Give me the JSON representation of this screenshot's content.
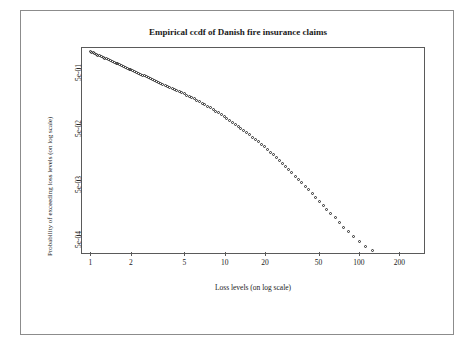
{
  "page": {
    "top_text_fragment": ""
  },
  "figure": {
    "title": "Empirical ccdf of Danish fire insurance claims"
  },
  "chart_data": {
    "type": "scatter",
    "title": "Empirical ccdf of Danish fire insurance claims",
    "xlabel": "Loss levels (on log scale)",
    "ylabel": "Probability of exceeding loss levels (on log scale)",
    "xscale": "log",
    "yscale": "log",
    "xlim": [
      0.85,
      300
    ],
    "ylim": [
      0.00025,
      1.2
    ],
    "xticks": [
      1,
      2,
      5,
      10,
      20,
      50,
      100,
      200
    ],
    "xticklabels": [
      "1",
      "2",
      "5",
      "10",
      "20",
      "50",
      "100",
      "200"
    ],
    "yticks": [
      0.0005,
      0.005,
      0.05,
      0.5
    ],
    "yticklabels": [
      "5e-04",
      "5e-03",
      "5e-02",
      "5e-01"
    ],
    "grid": false,
    "legend": null,
    "marker": "open-circle",
    "points": [
      [
        1.0,
        1.0
      ],
      [
        1.02,
        0.97
      ],
      [
        1.05,
        0.94
      ],
      [
        1.08,
        0.91
      ],
      [
        1.1,
        0.885
      ],
      [
        1.13,
        0.86
      ],
      [
        1.16,
        0.835
      ],
      [
        1.2,
        0.81
      ],
      [
        1.24,
        0.785
      ],
      [
        1.28,
        0.76
      ],
      [
        1.32,
        0.735
      ],
      [
        1.36,
        0.71
      ],
      [
        1.4,
        0.688
      ],
      [
        1.45,
        0.665
      ],
      [
        1.5,
        0.64
      ],
      [
        1.55,
        0.618
      ],
      [
        1.6,
        0.596
      ],
      [
        1.65,
        0.575
      ],
      [
        1.7,
        0.556
      ],
      [
        1.76,
        0.536
      ],
      [
        1.82,
        0.517
      ],
      [
        1.88,
        0.5
      ],
      [
        1.94,
        0.483
      ],
      [
        2.0,
        0.466
      ],
      [
        2.07,
        0.45
      ],
      [
        2.14,
        0.434
      ],
      [
        2.21,
        0.419
      ],
      [
        2.28,
        0.405
      ],
      [
        2.36,
        0.39
      ],
      [
        2.44,
        0.377
      ],
      [
        2.52,
        0.364
      ],
      [
        2.6,
        0.351
      ],
      [
        2.7,
        0.338
      ],
      [
        2.8,
        0.325
      ],
      [
        2.9,
        0.313
      ],
      [
        3.0,
        0.301
      ],
      [
        3.1,
        0.29
      ],
      [
        3.2,
        0.279
      ],
      [
        3.3,
        0.269
      ],
      [
        3.45,
        0.258
      ],
      [
        3.6,
        0.247
      ],
      [
        3.75,
        0.237
      ],
      [
        3.9,
        0.227
      ],
      [
        4.05,
        0.218
      ],
      [
        4.2,
        0.209
      ],
      [
        4.4,
        0.2
      ],
      [
        4.6,
        0.19
      ],
      [
        4.8,
        0.181
      ],
      [
        5.0,
        0.172
      ],
      [
        5.2,
        0.164
      ],
      [
        5.45,
        0.156
      ],
      [
        5.7,
        0.148
      ],
      [
        5.95,
        0.14
      ],
      [
        6.2,
        0.132
      ],
      [
        6.5,
        0.125
      ],
      [
        6.8,
        0.117
      ],
      [
        7.1,
        0.11
      ],
      [
        7.45,
        0.103
      ],
      [
        7.8,
        0.0965
      ],
      [
        8.2,
        0.0901
      ],
      [
        8.6,
        0.0841
      ],
      [
        9.0,
        0.0784
      ],
      [
        9.45,
        0.0729
      ],
      [
        9.9,
        0.0677
      ],
      [
        10.4,
        0.0627
      ],
      [
        10.9,
        0.058
      ],
      [
        11.4,
        0.0535
      ],
      [
        12.0,
        0.0493
      ],
      [
        12.6,
        0.0453
      ],
      [
        13.2,
        0.0416
      ],
      [
        13.9,
        0.0381
      ],
      [
        14.6,
        0.0348
      ],
      [
        15.3,
        0.0317
      ],
      [
        16.1,
        0.0288
      ],
      [
        16.9,
        0.0262
      ],
      [
        17.8,
        0.0237
      ],
      [
        18.7,
        0.0214
      ],
      [
        19.7,
        0.0193
      ],
      [
        20.7,
        0.0173
      ],
      [
        21.8,
        0.0155
      ],
      [
        23.0,
        0.0138
      ],
      [
        24.2,
        0.0123
      ],
      [
        25.5,
        0.0109
      ],
      [
        26.9,
        0.00965
      ],
      [
        28.4,
        0.00851
      ],
      [
        30.0,
        0.00749
      ],
      [
        31.7,
        0.00657
      ],
      [
        33.5,
        0.00575
      ],
      [
        35.4,
        0.00501
      ],
      [
        37.5,
        0.00435
      ],
      [
        39.7,
        0.00377
      ],
      [
        42.1,
        0.00325
      ],
      [
        44.7,
        0.00279
      ],
      [
        47.5,
        0.00238
      ],
      [
        50.6,
        0.00203
      ],
      [
        54.0,
        0.00172
      ],
      [
        57.7,
        0.00145
      ],
      [
        61.8,
        0.00122
      ],
      [
        66.4,
        0.00102
      ],
      [
        71.5,
        0.00085
      ],
      [
        77.3,
        0.0007
      ],
      [
        84.0,
        0.00058
      ],
      [
        91.8,
        0.00048
      ],
      [
        101.0,
        0.00039
      ],
      [
        112.0,
        0.00032
      ],
      [
        126.0,
        0.00027
      ],
      [
        144.0,
        0.00022
      ],
      [
        170.0,
        0.00018
      ],
      [
        210.0,
        0.00014
      ],
      [
        263.0,
        0.00011
      ]
    ]
  }
}
